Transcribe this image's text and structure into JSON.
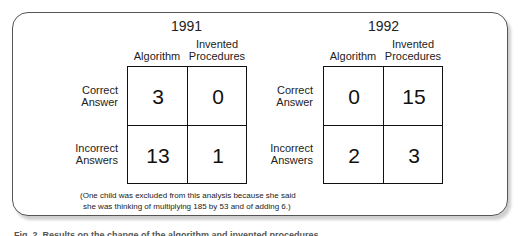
{
  "panels": [
    {
      "year": "1991",
      "col_headers": [
        "Algorithm",
        "Invented\nProcedures"
      ],
      "row_headers": [
        "Correct\nAnswer",
        "Incorrect\nAnswers"
      ],
      "cells": [
        [
          "3",
          "0"
        ],
        [
          "13",
          "1"
        ]
      ]
    },
    {
      "year": "1992",
      "col_headers": [
        "Algorithm",
        "Invented\nProcedures"
      ],
      "row_headers": [
        "Correct\nAnswer",
        "Incorrect\nAnswers"
      ],
      "cells": [
        [
          "0",
          "15"
        ],
        [
          "2",
          "3"
        ]
      ]
    }
  ],
  "note_line1": "(One child was excluded from this analysis because she said",
  "note_line2": "she was thinking of multiplying 185 by 53 and of adding 6.)",
  "caption": "Fig. 2. Results on the change of the algorithm and invented procedures"
}
